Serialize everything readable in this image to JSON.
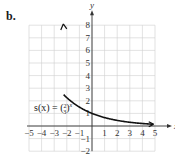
{
  "part_label": "b.",
  "function_label": {
    "lhs": "s(x) = (",
    "numerator": "2",
    "denominator": "3",
    "rhs": ")",
    "exponent": "x"
  },
  "chart_data": {
    "type": "line",
    "title": "",
    "xlabel": "x",
    "ylabel": "y",
    "xlim": [
      -5,
      5
    ],
    "ylim": [
      -2,
      8
    ],
    "grid": true,
    "x_ticks": [
      -5,
      -4,
      -3,
      -2,
      -1,
      1,
      2,
      3,
      4,
      5
    ],
    "y_ticks": [
      -2,
      -1,
      1,
      2,
      3,
      4,
      5,
      6,
      7,
      8
    ],
    "series": [
      {
        "name": "s(x) = (2/3)^x",
        "x": [
          -2.2,
          -2,
          -1.5,
          -1,
          -0.5,
          0,
          0.5,
          1,
          1.5,
          2,
          3,
          4,
          4.9
        ],
        "values": [
          2.44,
          2.25,
          1.84,
          1.5,
          1.22,
          1.0,
          0.82,
          0.67,
          0.54,
          0.44,
          0.3,
          0.2,
          0.14
        ]
      }
    ],
    "annotations": [
      "s(x) = (2/3)^x"
    ]
  }
}
